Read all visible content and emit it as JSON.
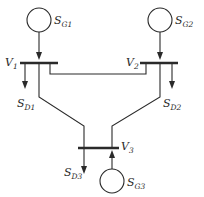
{
  "diagram": {
    "type": "three-bus power system one-line diagram",
    "colors": {
      "line": "#2a2a2a",
      "background": "#ffffff"
    },
    "generators": [
      {
        "id": "G1",
        "label_main": "S",
        "label_sub": "G1"
      },
      {
        "id": "G2",
        "label_main": "S",
        "label_sub": "G2"
      },
      {
        "id": "G3",
        "label_main": "S",
        "label_sub": "G3"
      }
    ],
    "loads": [
      {
        "id": "D1",
        "label_main": "S",
        "label_sub": "D1"
      },
      {
        "id": "D2",
        "label_main": "S",
        "label_sub": "D2"
      },
      {
        "id": "D3",
        "label_main": "S",
        "label_sub": "D3"
      }
    ],
    "buses": [
      {
        "id": "bus1",
        "label_main": "V",
        "label_sub": "1"
      },
      {
        "id": "bus2",
        "label_main": "V",
        "label_sub": "2"
      },
      {
        "id": "bus3",
        "label_main": "V",
        "label_sub": "3"
      }
    ],
    "lines": [
      {
        "from": "bus1",
        "to": "bus2"
      },
      {
        "from": "bus1",
        "to": "bus3"
      },
      {
        "from": "bus2",
        "to": "bus3"
      }
    ]
  }
}
